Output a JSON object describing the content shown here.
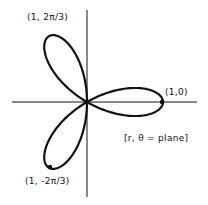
{
  "diagram": {
    "type": "polar-rose",
    "colors": {
      "ink": "#111111",
      "background": "#ffffff"
    },
    "axes": {
      "horizontal": true,
      "vertical": true
    },
    "petals": 3,
    "points": [
      {
        "id": "right",
        "label": "(1,0)"
      },
      {
        "id": "upper-left",
        "label": "(1, 2π/3)"
      },
      {
        "id": "lower-left",
        "label": "(1, -2π/3)"
      }
    ],
    "annotation": "[r, θ = plane]"
  }
}
